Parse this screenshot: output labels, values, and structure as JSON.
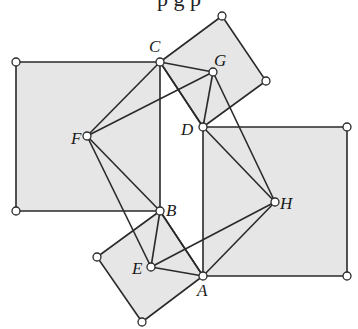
{
  "cropped_text": "p  g  p",
  "colors": {
    "fill": "#e6e6e6",
    "stroke": "#2a2a2a",
    "vertex_fill": "#ffffff"
  },
  "squares": [
    {
      "name": "left-square",
      "points": [
        [
          16,
          62
        ],
        [
          160,
          62
        ],
        [
          160,
          211
        ],
        [
          16,
          211
        ]
      ]
    },
    {
      "name": "top-tilted-square",
      "points": [
        [
          160,
          62
        ],
        [
          222,
          16
        ],
        [
          266,
          81
        ],
        [
          203,
          127
        ]
      ]
    },
    {
      "name": "right-square",
      "points": [
        [
          203,
          127
        ],
        [
          347,
          127
        ],
        [
          347,
          276
        ],
        [
          203,
          276
        ]
      ]
    },
    {
      "name": "bottom-tilted-square",
      "points": [
        [
          160,
          211
        ],
        [
          203,
          276
        ],
        [
          142,
          322
        ],
        [
          97,
          257
        ]
      ]
    }
  ],
  "points": {
    "A": [
      203,
      276
    ],
    "B": [
      160,
      211
    ],
    "C": [
      160,
      62
    ],
    "D": [
      203,
      127
    ],
    "E": [
      151,
      267
    ],
    "F": [
      87,
      136
    ],
    "G": [
      213,
      72
    ],
    "H": [
      275,
      202
    ]
  },
  "labels": [
    {
      "text": "C",
      "x": 149,
      "y": 52
    },
    {
      "text": "G",
      "x": 214,
      "y": 66
    },
    {
      "text": "D",
      "x": 181,
      "y": 135
    },
    {
      "text": "F",
      "x": 71,
      "y": 144
    },
    {
      "text": "B",
      "x": 166,
      "y": 216
    },
    {
      "text": "H",
      "x": 280,
      "y": 209
    },
    {
      "text": "E",
      "x": 132,
      "y": 274
    },
    {
      "text": "A",
      "x": 197,
      "y": 296
    }
  ],
  "segments": [
    [
      "C",
      "F"
    ],
    [
      "F",
      "G"
    ],
    [
      "F",
      "B"
    ],
    [
      "F",
      "E"
    ],
    [
      "C",
      "G"
    ],
    [
      "C",
      "D"
    ],
    [
      "G",
      "D"
    ],
    [
      "G",
      "H"
    ],
    [
      "D",
      "H"
    ],
    [
      "B",
      "E"
    ],
    [
      "E",
      "A"
    ],
    [
      "E",
      "H"
    ],
    [
      "B",
      "A"
    ],
    [
      "A",
      "H"
    ]
  ],
  "extra_vertices": [
    [
      16,
      62
    ],
    [
      16,
      211
    ],
    [
      222,
      16
    ],
    [
      266,
      81
    ],
    [
      347,
      127
    ],
    [
      347,
      276
    ],
    [
      97,
      257
    ],
    [
      142,
      322
    ]
  ]
}
